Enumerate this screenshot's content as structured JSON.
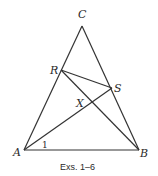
{
  "diagram": {
    "caption": "Exs. 1–6",
    "points": {
      "A": {
        "label": "A",
        "x": 24,
        "y": 150
      },
      "B": {
        "label": "B",
        "x": 139,
        "y": 150
      },
      "C": {
        "label": "C",
        "x": 82,
        "y": 26
      },
      "R": {
        "label": "R",
        "x": 61,
        "y": 70
      },
      "S": {
        "label": "S",
        "x": 112,
        "y": 88
      },
      "X": {
        "label": "X",
        "x": 92,
        "y": 103
      }
    },
    "angle_label": "1",
    "segments": [
      "AC",
      "BC",
      "AB",
      "RS",
      "RB",
      "AS"
    ]
  }
}
